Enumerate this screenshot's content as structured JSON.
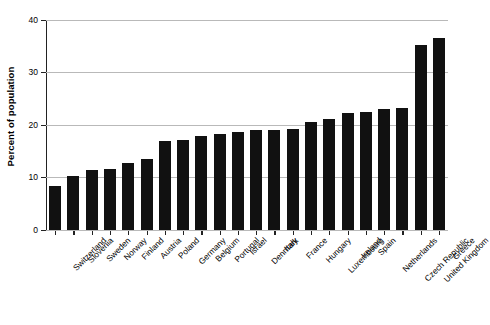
{
  "chart_data": {
    "type": "bar",
    "title": "",
    "subtitle": "",
    "xlabel": "",
    "ylabel": "Percent of population",
    "ylim": [
      0,
      40
    ],
    "yticks": [
      0,
      10,
      20,
      30,
      40
    ],
    "ytick_labels": [
      "0",
      "10",
      "20",
      "30",
      "40"
    ],
    "grid": true,
    "legend": "none",
    "bar_color": "#111111",
    "categories": [
      "Switzerland",
      "Slovenia",
      "Sweden",
      "Norway",
      "Finland",
      "Austria",
      "Poland",
      "Germany",
      "Belgium",
      "Portugal",
      "Israel",
      "Denmark",
      "Italy",
      "France",
      "Hungary",
      "Luxembourg",
      "Ireland",
      "Spain",
      "Netherlands",
      "Czech Republic",
      "United Kingdom",
      "Greece"
    ],
    "values": [
      8.3,
      10.2,
      11.5,
      11.7,
      12.7,
      13.6,
      17.0,
      17.2,
      17.9,
      18.2,
      18.7,
      19.0,
      19.1,
      19.3,
      20.6,
      21.2,
      22.3,
      22.5,
      23.0,
      23.2,
      35.2,
      36.5
    ]
  }
}
